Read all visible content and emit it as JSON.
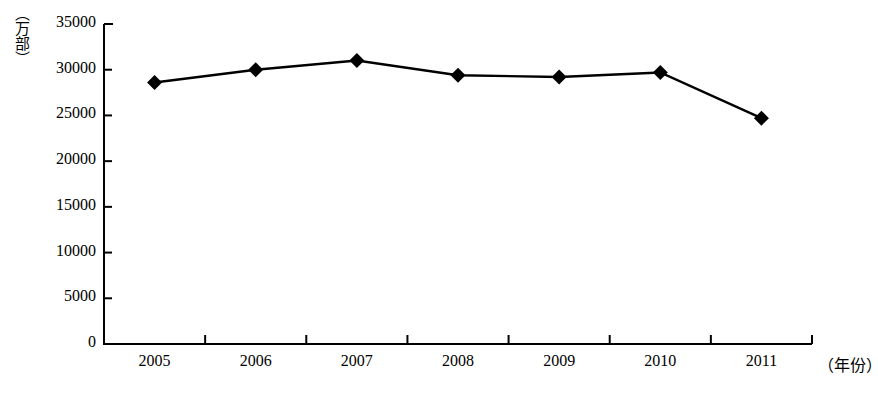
{
  "chart_data": {
    "type": "line",
    "title": "",
    "subtitle": "",
    "xlabel": "（年份）",
    "ylabel": "（万部）",
    "categories": [
      "2005",
      "2006",
      "2007",
      "2008",
      "2009",
      "2010",
      "2011"
    ],
    "values": [
      28600,
      30000,
      31000,
      29400,
      29200,
      29700,
      24700
    ],
    "series": [
      {
        "name": "",
        "values": [
          28600,
          30000,
          31000,
          29400,
          29200,
          29700,
          24700
        ]
      }
    ],
    "ylim": [
      0,
      35000
    ],
    "ytick_labels": [
      "0",
      "5000",
      "10000",
      "15000",
      "20000",
      "25000",
      "30000",
      "35000"
    ],
    "ytick_values": [
      0,
      5000,
      10000,
      15000,
      20000,
      25000,
      30000,
      35000
    ],
    "xtick_labels": [
      "2005",
      "2006",
      "2007",
      "2008",
      "2009",
      "2010",
      "2011"
    ],
    "grid": false,
    "legend": false,
    "legend_position": "none",
    "marker": "diamond",
    "line_color": "#000000",
    "marker_color": "#000000",
    "axis_color": "#000000",
    "background_color": "#ffffff"
  },
  "axes": {
    "y_title": "（万部）",
    "x_title": "（年份）"
  }
}
